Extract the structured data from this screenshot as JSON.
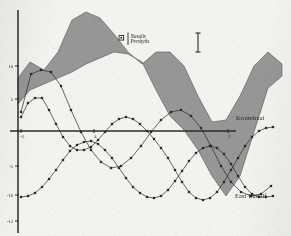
{
  "figure": {
    "background_color": "#f3f2ee",
    "ink_color": "#2b2a28",
    "band_fill": "#8e8e8e",
    "band_stroke": "#55544f"
  },
  "legend": {
    "marker_name": "square-marker-icon",
    "line1": "Nasalis",
    "line2": "Presbytis"
  },
  "scalebar": {
    "name": "vertical-scale-bar",
    "label": ""
  },
  "labels": {
    "kromdraai": "Kromdraai",
    "east_rudolf": "East Rudolf"
  },
  "axes": {
    "y_ticks": [
      "10",
      "5",
      "-5",
      "-10",
      "-15"
    ],
    "y_tick_py": [
      66,
      99,
      166,
      195,
      221
    ],
    "x_ticks": [
      "-5",
      "4",
      "2"
    ],
    "x_tick_px": [
      21,
      94,
      228
    ],
    "x_axis_py": 131,
    "y_axis_px": 18
  },
  "chart_data": {
    "type": "line",
    "title": "",
    "xlabel": "",
    "ylabel": "",
    "xlim": [
      -8,
      14
    ],
    "ylim": [
      -18,
      16
    ],
    "grid": false,
    "legend_position": "top-center",
    "bands": [
      {
        "name": "Nasalis–Presbytis envelope",
        "fill": "#8e8e8e",
        "upper_px": "M 18 78 L 30 62 L 44 70 L 58 52 L 72 20 L 86 12 L 100 18 L 114 34 L 128 52 L 142 64 L 156 52 L 170 52 L 184 66 L 198 96 L 212 122 L 226 120 L 240 96 L 254 66 L 268 52 L 282 64",
        "lower_px": "M 18 104 L 30 90 L 44 84 L 58 78 L 72 72 L 86 64 L 100 58 L 114 52 L 128 54 L 142 62 L 156 90 L 170 116 L 184 130 L 198 150 L 212 176 L 226 196 L 240 176 L 254 132 L 268 88 L 282 76"
      }
    ],
    "series": [
      {
        "name": "Kromdraai",
        "marker": "square",
        "color": "#2b2a28",
        "label_anchor_px": [
          231,
          118
        ],
        "points_px": [
          [
            21,
            117
          ],
          [
            28,
            103
          ],
          [
            35,
            98
          ],
          [
            42,
            98
          ],
          [
            49,
            110
          ],
          [
            56,
            124
          ],
          [
            63,
            137
          ],
          [
            70,
            146
          ],
          [
            77,
            150
          ],
          [
            84,
            150
          ],
          [
            91,
            147
          ],
          [
            98,
            140
          ],
          [
            105,
            132
          ],
          [
            112,
            124
          ],
          [
            119,
            119
          ],
          [
            126,
            117
          ],
          [
            133,
            119
          ],
          [
            140,
            124
          ],
          [
            147,
            131
          ],
          [
            154,
            139
          ],
          [
            161,
            148
          ],
          [
            168,
            158
          ],
          [
            175,
            170
          ],
          [
            182,
            182
          ],
          [
            189,
            192
          ],
          [
            196,
            198
          ],
          [
            203,
            200
          ],
          [
            210,
            198
          ],
          [
            217,
            192
          ],
          [
            224,
            182
          ],
          [
            231,
            170
          ],
          [
            238,
            158
          ],
          [
            245,
            146
          ],
          [
            252,
            137
          ],
          [
            259,
            131
          ],
          [
            266,
            128
          ],
          [
            273,
            127
          ]
        ]
      },
      {
        "name": "East Rudolf",
        "marker": "square",
        "color": "#2b2a28",
        "label_anchor_px": [
          230,
          196
        ],
        "points_px": [
          [
            21,
            197
          ],
          [
            28,
            196
          ],
          [
            35,
            193
          ],
          [
            42,
            187
          ],
          [
            49,
            179
          ],
          [
            56,
            170
          ],
          [
            63,
            160
          ],
          [
            70,
            151
          ],
          [
            77,
            145
          ],
          [
            84,
            142
          ],
          [
            91,
            141
          ],
          [
            98,
            144
          ],
          [
            105,
            150
          ],
          [
            112,
            158
          ],
          [
            119,
            168
          ],
          [
            126,
            178
          ],
          [
            133,
            187
          ],
          [
            140,
            193
          ],
          [
            147,
            197
          ],
          [
            154,
            198
          ],
          [
            161,
            196
          ],
          [
            168,
            190
          ],
          [
            175,
            181
          ],
          [
            182,
            171
          ],
          [
            189,
            161
          ],
          [
            196,
            153
          ],
          [
            203,
            148
          ],
          [
            210,
            146
          ],
          [
            217,
            148
          ],
          [
            224,
            154
          ],
          [
            231,
            164
          ],
          [
            238,
            176
          ],
          [
            245,
            187
          ],
          [
            252,
            194
          ],
          [
            259,
            197
          ],
          [
            266,
            197
          ],
          [
            273,
            196
          ]
        ]
      },
      {
        "name": "third-curve",
        "marker": "square",
        "color": "#2b2a28",
        "label_anchor_px": null,
        "points_px": [
          [
            21,
            112
          ],
          [
            31,
            74
          ],
          [
            41,
            70
          ],
          [
            51,
            72
          ],
          [
            61,
            86
          ],
          [
            71,
            110
          ],
          [
            81,
            132
          ],
          [
            91,
            150
          ],
          [
            101,
            162
          ],
          [
            111,
            168
          ],
          [
            121,
            166
          ],
          [
            131,
            158
          ],
          [
            141,
            146
          ],
          [
            151,
            132
          ],
          [
            161,
            120
          ],
          [
            171,
            112
          ],
          [
            181,
            110
          ],
          [
            191,
            116
          ],
          [
            201,
            128
          ],
          [
            211,
            146
          ],
          [
            221,
            166
          ],
          [
            231,
            182
          ],
          [
            241,
            192
          ],
          [
            251,
            196
          ],
          [
            261,
            194
          ],
          [
            271,
            186
          ]
        ]
      }
    ]
  }
}
